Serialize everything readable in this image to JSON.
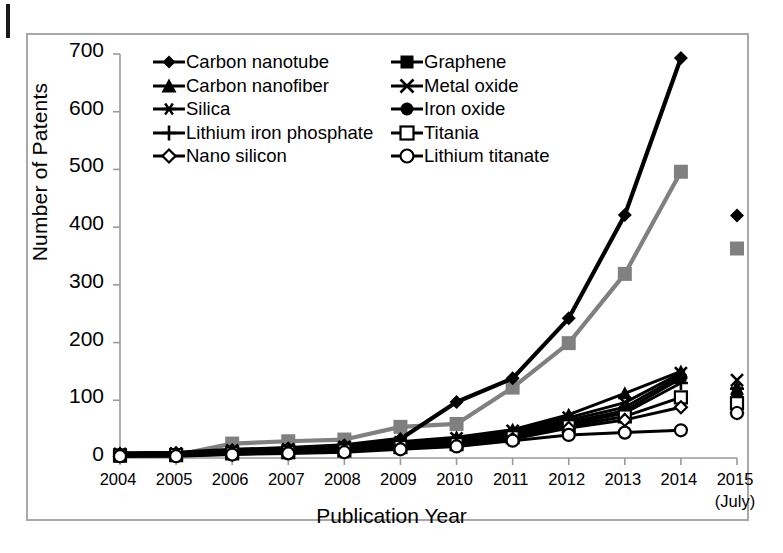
{
  "figure": {
    "background_color": "#ffffff",
    "frame_color": "#a8a8a8",
    "series_color": "#000000",
    "secondary_series_color": "#808080"
  },
  "axes": {
    "ylabel": "Number of Patents",
    "xlabel": "Publication Year",
    "yticks": [
      "0",
      "100",
      "200",
      "300",
      "400",
      "500",
      "600",
      "700"
    ],
    "xticks": [
      "2004",
      "2005",
      "2006",
      "2007",
      "2008",
      "2009",
      "2010",
      "2011",
      "2012",
      "2013",
      "2014",
      "2015"
    ],
    "xtick_sublabel": "(July)"
  },
  "legend": {
    "column_left": [
      {
        "label": "Carbon nanotube",
        "marker": "filled-diamond-icon"
      },
      {
        "label": "Carbon nanofiber",
        "marker": "filled-triangle-icon"
      },
      {
        "label": "Silica",
        "marker": "asterisk-icon"
      },
      {
        "label": "Lithium iron phosphate",
        "marker": "plus-icon"
      },
      {
        "label": "Nano silicon",
        "marker": "open-diamond-icon"
      }
    ],
    "column_right": [
      {
        "label": "Graphene",
        "marker": "filled-square-icon"
      },
      {
        "label": "Metal oxide",
        "marker": "cross-icon"
      },
      {
        "label": "Iron oxide",
        "marker": "filled-circle-icon"
      },
      {
        "label": "Titania",
        "marker": "open-square-icon"
      },
      {
        "label": "Lithium titanate",
        "marker": "open-circle-icon"
      }
    ]
  },
  "chart_data": {
    "type": "line",
    "title": "",
    "xlabel": "Publication Year",
    "ylabel": "Number of Patents",
    "categories": [
      "2004",
      "2005",
      "2006",
      "2007",
      "2008",
      "2009",
      "2010",
      "2011",
      "2012",
      "2013",
      "2014",
      "2015"
    ],
    "ylim": [
      0,
      700
    ],
    "xlim_note": "2015 values are July year-to-date and are drawn as isolated markers with no connecting line",
    "grid": false,
    "legend_position": "upper-left-inside",
    "series": [
      {
        "name": "Carbon nanotube",
        "marker": "filled-diamond",
        "color": "#000000",
        "values": [
          8,
          9,
          14,
          17,
          22,
          33,
          97,
          138,
          242,
          421,
          693,
          420
        ]
      },
      {
        "name": "Graphene",
        "marker": "filled-square",
        "color": "#808080",
        "values": [
          5,
          5,
          25,
          29,
          32,
          54,
          59,
          122,
          199,
          319,
          496,
          363
        ]
      },
      {
        "name": "Carbon nanofiber",
        "marker": "filled-triangle",
        "color": "#000000",
        "values": [
          6,
          7,
          12,
          16,
          20,
          28,
          36,
          49,
          75,
          112,
          150,
          120
        ]
      },
      {
        "name": "Metal oxide",
        "marker": "cross",
        "color": "#000000",
        "values": [
          7,
          8,
          13,
          15,
          19,
          27,
          34,
          47,
          70,
          96,
          147,
          135
        ]
      },
      {
        "name": "Silica",
        "marker": "asterisk",
        "color": "#000000",
        "values": [
          6,
          7,
          11,
          14,
          18,
          25,
          31,
          44,
          66,
          88,
          143,
          122
        ]
      },
      {
        "name": "Iron oxide",
        "marker": "filled-circle",
        "color": "#000000",
        "values": [
          5,
          6,
          10,
          13,
          16,
          23,
          29,
          42,
          62,
          82,
          138,
          110
        ]
      },
      {
        "name": "Lithium iron phosphate",
        "marker": "plus",
        "color": "#000000",
        "values": [
          4,
          5,
          9,
          11,
          15,
          21,
          26,
          39,
          58,
          78,
          130,
          120
        ]
      },
      {
        "name": "Titania",
        "marker": "open-square",
        "color": "#000000",
        "values": [
          4,
          5,
          8,
          10,
          13,
          19,
          24,
          36,
          55,
          72,
          105,
          95
        ]
      },
      {
        "name": "Nano silicon",
        "marker": "open-diamond",
        "color": "#000000",
        "values": [
          3,
          4,
          7,
          9,
          12,
          17,
          22,
          33,
          52,
          66,
          88,
          78
        ]
      },
      {
        "name": "Lithium titanate",
        "marker": "open-circle",
        "color": "#000000",
        "values": [
          3,
          3,
          6,
          8,
          10,
          15,
          20,
          30,
          40,
          44,
          48,
          78
        ]
      }
    ]
  }
}
